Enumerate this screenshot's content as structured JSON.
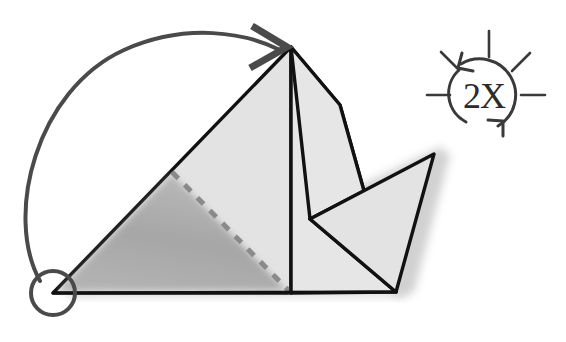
{
  "document": {
    "title": "Origami Fold Step Diagram",
    "background_color": "#ffffff",
    "width": 566,
    "height": 342
  },
  "palette": {
    "paper_light": "#e3e3e3",
    "paper_light_2": "#e6e6e6",
    "paper_outline": "#111111",
    "shadow_gray": "#8a8a8a",
    "shadow_gray_dark": "#7d7d7d",
    "drop_shadow": "#c9c9c9",
    "arrow_gray": "#4a4a4a",
    "badge_stroke": "#3a3a3a",
    "fold_dash": "#8a8a8a",
    "text_dark": "#2b2b2b"
  },
  "model": {
    "name": "folded-paper-model",
    "description": "Light gray origami figure with triangular left body, central vertical crease, pointed upper-right flap and a right-pointing wing",
    "apex": {
      "x": 291,
      "y": 47
    },
    "bottom_left": {
      "x": 53,
      "y": 293
    },
    "bottom_right": {
      "x": 396,
      "y": 292
    },
    "center_crease_top": {
      "x": 291,
      "y": 47
    },
    "center_crease_bottom": {
      "x": 291,
      "y": 293
    },
    "right_shoulder": {
      "x": 340,
      "y": 105
    },
    "flap_tip": {
      "x": 364,
      "y": 191
    },
    "notch": {
      "x": 310,
      "y": 219
    },
    "wing_tip": {
      "x": 434,
      "y": 154
    }
  },
  "fold_line": {
    "name": "dashed-fold-crease",
    "style": "dashed",
    "from": {
      "x": 172,
      "y": 172
    },
    "to": {
      "x": 291,
      "y": 293
    },
    "dash_pattern": "9 9",
    "stroke_width": 5
  },
  "shadow_triangle": {
    "name": "under-layer-shadow",
    "points": "56,292 172,173 288,291",
    "opacity": 0.62,
    "blur": 3
  },
  "flip_arrow": {
    "name": "fold-rotation-arrow",
    "description": "Large curved arrow sweeping from the circled bottom-left corner up and over to the apex",
    "start_marker": {
      "shape": "circle",
      "cx": 53,
      "cy": 293,
      "r": 22,
      "stroke_width": 4
    },
    "path": "M 40 283 C 6 218 36 92 122 51 C 185 21 245 32 279 50",
    "stroke_width": 4,
    "arrowhead": {
      "type": "open-chevron",
      "points": "251,27 285,47 249,67",
      "stroke_width": 6
    }
  },
  "repeat_badge": {
    "name": "repeat-twice-badge",
    "label": "2X",
    "center": {
      "x": 484,
      "y": 95
    },
    "radius": 32,
    "stroke_width": 3,
    "ray_count": 5,
    "rays": [
      {
        "name": "ray-left",
        "x1": 427,
        "y1": 95,
        "x2": 450,
        "y2": 95
      },
      {
        "name": "ray-upper-left",
        "x1": 442,
        "y1": 53,
        "x2": 459,
        "y2": 70
      },
      {
        "name": "ray-top",
        "x1": 489,
        "y1": 33,
        "x2": 489,
        "y2": 58
      },
      {
        "name": "ray-upper-right",
        "x1": 528,
        "y1": 54,
        "x2": 511,
        "y2": 71
      },
      {
        "name": "ray-right",
        "x1": 521,
        "y1": 95,
        "x2": 544,
        "y2": 95
      }
    ],
    "arrow_top": {
      "name": "badge-arrowhead-top",
      "points": "461,57 455,70 469,72"
    },
    "arrow_bottom": {
      "name": "badge-arrowhead-bottom",
      "points": "498,133 504,120 490,118"
    }
  },
  "drop_shadow": {
    "name": "model-drop-shadow",
    "points": "300,215 440,147 448,153 412,290 404,296",
    "color": "#c9c9c9",
    "blur": 4
  }
}
